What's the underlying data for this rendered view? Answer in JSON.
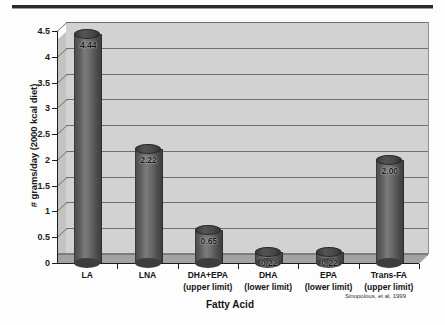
{
  "chart_data": {
    "type": "bar",
    "title": "",
    "subtitle": "",
    "xlabel": "Fatty Acid",
    "ylabel": "# grams/day (2000 kcal diet)",
    "categories": [
      "LA",
      "LNA",
      "DHA+EPA",
      "DHA",
      "EPA",
      "Trans-FA"
    ],
    "category_sublabels": [
      "",
      "",
      "(upper limit)",
      "(lower limit)",
      "(lower limit)",
      "(upper limit)"
    ],
    "values": [
      4.44,
      2.22,
      0.65,
      0.22,
      0.22,
      2.0
    ],
    "value_labels": [
      "4.44",
      "2.22",
      "0.65",
      "0.22",
      "0.22",
      "2.00"
    ],
    "ylim": [
      0,
      4.5
    ],
    "ytick_values": [
      0,
      0.5,
      1,
      1.5,
      2,
      2.5,
      3,
      3.5,
      4,
      4.5
    ],
    "ytick_labels": [
      "0",
      "0.5",
      "1",
      "1.5",
      "2",
      "2.5",
      "3",
      "3.5",
      "4",
      "4.5"
    ],
    "grid": true,
    "grid_axis": "y",
    "legend": false,
    "legend_position": "none",
    "style": "3d-cylinder",
    "bar_color": "#5d5d5d",
    "plot_background": "#d2d2d2",
    "axis_color": "#1d1d1d",
    "gridline_color": "#6f6f6f"
  },
  "annotations": {
    "citation": "Sinopolous, et al, 1999"
  }
}
